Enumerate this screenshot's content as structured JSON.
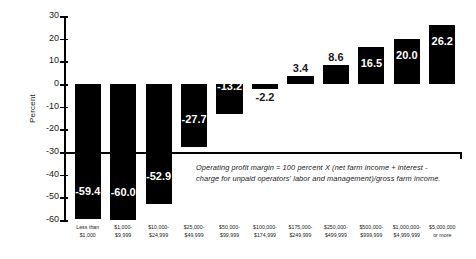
{
  "chart_data": {
    "type": "bar",
    "title": "",
    "xlabel": "",
    "ylabel": "Percent",
    "ylim": [
      -60,
      30
    ],
    "ytick_step": 10,
    "grid": false,
    "legend": null,
    "yticks": [
      "30",
      "20",
      "10",
      "0",
      "-10",
      "-20",
      "-30",
      "-40",
      "-50",
      "-60"
    ],
    "categories": [
      "Less than $1,000",
      "$1,000-$9,999",
      "$10,000-$24,999",
      "$25,000-$49,999",
      "$50,000-$99,999",
      "$100,000-$174,999",
      "$175,000-$249,999",
      "$250,000-$499,999",
      "$500,000-$999,999",
      "$1,000,000-$4,999,999",
      "$5,000,000 or more"
    ],
    "category_lines": [
      [
        "Less than",
        "$1,000"
      ],
      [
        "$1,000-",
        "$9,999"
      ],
      [
        "$10,000-",
        "$24,999"
      ],
      [
        "$25,000-",
        "$49,999"
      ],
      [
        "$50,000-",
        "$99,999"
      ],
      [
        "$100,000-",
        "$174,999"
      ],
      [
        "$175,000-",
        "$249,999"
      ],
      [
        "$250,000-",
        "$499,999"
      ],
      [
        "$500,000-",
        "$999,999"
      ],
      [
        "$1,000,000-",
        "$4,999,999"
      ],
      [
        "$5,000,000",
        "or more"
      ]
    ],
    "values": [
      -59.4,
      -60.0,
      -52.9,
      -27.7,
      -13.2,
      -2.2,
      3.4,
      8.6,
      16.5,
      20.0,
      26.2
    ],
    "value_labels": [
      "-59.4",
      "-60.0",
      "-52.9",
      "-27.7",
      "-13.2",
      "-2.2",
      "3.4",
      "8.6",
      "16.5",
      "20.0",
      "26.2"
    ],
    "bar_color": "#000000",
    "axis_color": "#000000",
    "inside_label_color": "#ffffff",
    "outside_label_color": "#1a1a1a"
  },
  "annotation": {
    "text": "Operating profit margin = 100 percent X (net farm income + interest -charge for unpaid operators' labor and management)/gross farm income."
  }
}
